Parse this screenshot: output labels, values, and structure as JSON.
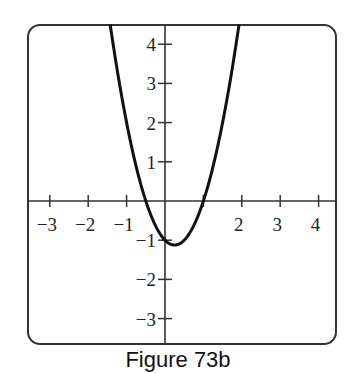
{
  "chart_data": {
    "type": "line",
    "title": "",
    "caption": "Figure 73b",
    "xlabel": "",
    "ylabel": "",
    "xlim": [
      -3.6,
      4.6
    ],
    "ylim": [
      -3.65,
      4.5
    ],
    "grid": false,
    "legend": null,
    "x_ticks": [
      -3,
      -2,
      -1,
      1,
      2,
      3,
      4
    ],
    "x_tick_labels": [
      "−3",
      "−2",
      "−1",
      "",
      "2",
      "3",
      "4"
    ],
    "y_ticks": [
      4,
      3,
      2,
      1,
      -1,
      -2,
      -3
    ],
    "y_tick_labels": [
      "4",
      "3",
      "2",
      "1",
      "−1",
      "−2",
      "−3"
    ],
    "series": [
      {
        "name": "y = 2x^2 - x - 1",
        "color": "#111111",
        "x": [
          -1.43,
          -1.25,
          -1.0,
          -0.75,
          -0.5,
          -0.25,
          0.0,
          0.25,
          0.5,
          0.75,
          1.0,
          1.25,
          1.5,
          1.75,
          1.93
        ],
        "y": [
          4.52,
          3.38,
          2.0,
          0.875,
          0.0,
          -0.625,
          -1.0,
          -1.125,
          -1.0,
          -0.625,
          0.0,
          0.875,
          2.0,
          3.375,
          4.52
        ]
      }
    ],
    "annotations": {
      "vertex": [
        0.25,
        -1.125
      ],
      "x_intercepts": [
        -0.5,
        1.0
      ],
      "y_intercept": -1.0
    }
  },
  "frame": {
    "border_color": "#333333",
    "corner_radius": 12
  }
}
